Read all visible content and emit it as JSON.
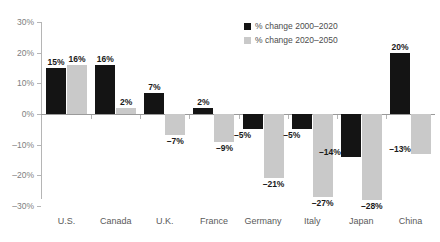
{
  "chart_data": {
    "type": "bar",
    "title": "",
    "subtitle": "",
    "xlabel": "",
    "ylabel": "",
    "ylim": [
      -30,
      30
    ],
    "ytick_labels": [
      "30%",
      "20%",
      "10%",
      "0%",
      "-10%",
      "-20%",
      "-30%"
    ],
    "ytick_values": [
      30,
      20,
      10,
      0,
      -10,
      -20,
      -30
    ],
    "grid": false,
    "legend_position": "top-right",
    "categories": [
      "U.S.",
      "Canada",
      "U.K.",
      "France",
      "Germany",
      "Italy",
      "Japan",
      "China"
    ],
    "series": [
      {
        "name": "% change 2000–2020",
        "color": "#141414",
        "values": [
          15,
          16,
          7,
          2,
          -5,
          -5,
          -14,
          20
        ],
        "labels": [
          "15%",
          "16%",
          "7%",
          "2%",
          "–5%",
          "–5%",
          "–14%",
          "20%"
        ]
      },
      {
        "name": "% change 2020–2050",
        "color": "#c9c9c9",
        "values": [
          16,
          2,
          -7,
          -9,
          -21,
          -27,
          -28,
          -13
        ],
        "labels": [
          "16%",
          "2%",
          "–7%",
          "–9%",
          "–21%",
          "–27%",
          "–28%",
          "–13%"
        ]
      }
    ]
  },
  "legend": {
    "items": [
      {
        "label": "% change 2000–2020",
        "swatch": "dark"
      },
      {
        "label": "% change 2020–2050",
        "swatch": "light"
      }
    ]
  }
}
